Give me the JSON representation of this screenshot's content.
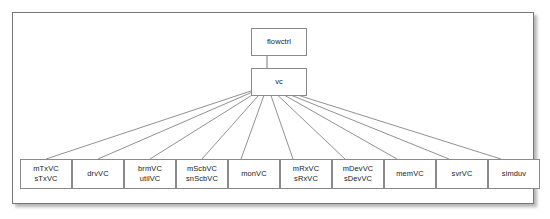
{
  "diagram": {
    "type": "class-hierarchy",
    "title": "",
    "root": {
      "id": "flowctrl",
      "label": "flowctrl"
    },
    "parent": {
      "id": "vc",
      "label": "vc"
    },
    "edges": {
      "vc_to_flowctrl": {
        "from": "vc",
        "to": "flowctrl",
        "arrow": "filled-arrowhead-up"
      },
      "leaf_to_vc_arrow": "filled-arrowhead"
    },
    "children": [
      {
        "id": "mTxVC",
        "lines": [
          "mTxVC",
          "sTxVC"
        ]
      },
      {
        "id": "drvVC",
        "lines": [
          "drvVC"
        ]
      },
      {
        "id": "brmVC",
        "lines": [
          "brmVC",
          "utilVC"
        ]
      },
      {
        "id": "mScbVC",
        "lines": [
          "mScbVC",
          "snScbVC"
        ]
      },
      {
        "id": "monVC",
        "lines": [
          "monVC"
        ]
      },
      {
        "id": "mRxVC",
        "lines": [
          "mRxVC",
          "sRxVC"
        ]
      },
      {
        "id": "mDevVC",
        "lines": [
          "mDevVC",
          "sDevVC"
        ]
      },
      {
        "id": "memVC",
        "lines": [
          "memVC"
        ]
      },
      {
        "id": "svrVC",
        "lines": [
          "svrVC"
        ]
      },
      {
        "id": "simduv",
        "lines": [
          "simduv"
        ]
      }
    ],
    "colors": {
      "frame_border": "#777777",
      "node_border": "#8a8a8a",
      "node_fill": "#ffffff",
      "connector": "#555555",
      "text": "#1a1a1a",
      "background": "#ffffff"
    }
  }
}
